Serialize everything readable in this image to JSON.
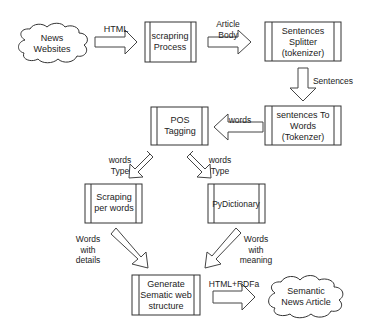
{
  "diagram": {
    "nodes": {
      "news_websites": {
        "line1": "News",
        "line2": "Websites",
        "shape": "cloud"
      },
      "scraping_process": {
        "line1": "scrapring",
        "line2": "Process",
        "shape": "process"
      },
      "sentences_splitter": {
        "line1": "Sentences",
        "line2": "Splitter",
        "line3": "(tokenizer)",
        "shape": "process"
      },
      "sentences_to_words": {
        "line1": "sentences To",
        "line2": "Words",
        "line3": "(Tokenzer)",
        "shape": "process"
      },
      "pos_tagging": {
        "line1": "POS",
        "line2": "Tagging",
        "shape": "process"
      },
      "scraping_per_words": {
        "line1": "Scraping",
        "line2": "per words",
        "shape": "process"
      },
      "pydictionary": {
        "line1": "PyDictionary",
        "shape": "process"
      },
      "generate_semantic": {
        "line1": "Generate",
        "line2": "Sematic web",
        "line3": "structure",
        "shape": "process"
      },
      "semantic_news_article": {
        "line1": "Semantic",
        "line2": "News Article",
        "shape": "cloud"
      }
    },
    "edges": {
      "html": {
        "line1": "HTML"
      },
      "article_body": {
        "line1": "Article",
        "line2": "Body"
      },
      "sentences": {
        "line1": "Sentences"
      },
      "words": {
        "line1": "words"
      },
      "words_type_left": {
        "line1": "words",
        "line2": "Type"
      },
      "words_type_right": {
        "line1": "words",
        "line2": "Type"
      },
      "words_with_details": {
        "line1": "Words",
        "line2": "with",
        "line3": "details"
      },
      "words_with_meaning": {
        "line1": "Words",
        "line2": "with",
        "line3": "meaning"
      },
      "html_rdfa": {
        "line1": "HTML+RDFa"
      }
    }
  }
}
